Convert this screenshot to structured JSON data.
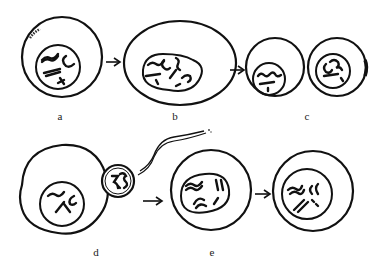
{
  "figure": {
    "colors": {
      "ink": "#111111",
      "background": "#ffffff"
    },
    "panels": [
      {
        "id": "a",
        "label": "a",
        "stage": "primary oocyte with condensed chromosomes"
      },
      {
        "id": "b",
        "label": "b",
        "stage": "enlarged oocyte with large nucleus"
      },
      {
        "id": "c",
        "label": "c",
        "stage": "two daughter cells after division"
      },
      {
        "id": "d",
        "label": "d",
        "stage": "sperm contacting egg"
      },
      {
        "id": "e",
        "label": "e",
        "stage": "fertilized egg with chromosomes"
      }
    ],
    "arrows": [
      {
        "from": "a",
        "to": "b"
      },
      {
        "from": "b",
        "to": "c"
      },
      {
        "from": "d",
        "to": "e"
      },
      {
        "from": "e",
        "to": "e2"
      }
    ]
  }
}
